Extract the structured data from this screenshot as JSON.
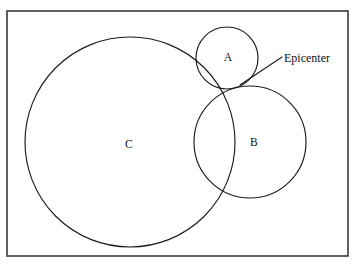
{
  "figure": {
    "type": "trilateration-diagram",
    "width": 359,
    "height": 267,
    "background_color": "#ffffff",
    "line_color": "#1b1b1b",
    "frame_color": "#3a3a3a"
  },
  "frame": {
    "name": "diagram-border",
    "x": 7,
    "y": 11,
    "width": 341,
    "height": 245,
    "stroke_width": 1.6
  },
  "circles": [
    {
      "id": "A",
      "label": "A",
      "cx": 227,
      "cy": 58,
      "r": 31,
      "label_x": 228,
      "label_y": 58
    },
    {
      "id": "B",
      "label": "B",
      "cx": 250,
      "cy": 142,
      "r": 56,
      "label_x": 254,
      "label_y": 143
    },
    {
      "id": "C",
      "label": "C",
      "cx": 130,
      "cy": 142,
      "r": 105,
      "label_x": 129,
      "label_y": 145
    }
  ],
  "annotation": {
    "label": "Epicenter",
    "text_x": 284,
    "text_y": 62,
    "leader_x1": 282,
    "leader_y1": 57,
    "leader_x2": 240,
    "leader_y2": 85
  },
  "chart_data": {
    "type": "scatter",
    "xlabel": "",
    "ylabel": "",
    "grid": false,
    "legend": null,
    "series": [
      {
        "name": "A",
        "shape": "circle",
        "center": [
          227,
          58
        ],
        "radius": 31
      },
      {
        "name": "B",
        "shape": "circle",
        "center": [
          250,
          142
        ],
        "radius": 56
      },
      {
        "name": "C",
        "shape": "circle",
        "center": [
          130,
          142
        ],
        "radius": 105
      }
    ],
    "annotations": [
      {
        "text": "Epicenter",
        "points_to": [
          240,
          85
        ],
        "text_at": [
          284,
          62
        ]
      }
    ]
  }
}
